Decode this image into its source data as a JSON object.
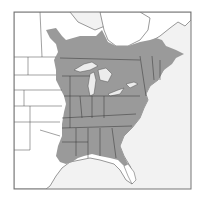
{
  "map": {
    "type": "range-map",
    "region": "Eastern North America",
    "colors": {
      "range_fill": "#9a9a9a",
      "land": "#ffffff",
      "water": "#f2f2f2",
      "border": "#3a3a3a",
      "frame": "#777777"
    },
    "legend": {
      "shaded": "Species range (eastern US and southern Canada)"
    }
  }
}
